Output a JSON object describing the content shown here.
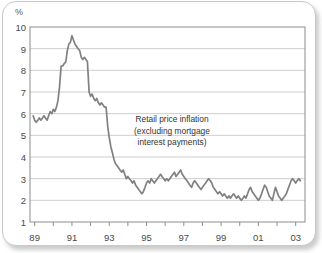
{
  "figure": {
    "unit_label": "%",
    "annotation_lines": [
      "Retail price inflation",
      "(excluding mortgage",
      "interest payments)"
    ],
    "line_color": "#808080",
    "grid_color": "#c0c0c0",
    "axis_color": "#8c8c8c",
    "frame_color": "#c9c9c9",
    "background_color": "#ffffff",
    "text_color": "#4a4a4a"
  },
  "chart_data": {
    "type": "line",
    "subtitle": "",
    "xlabel": "",
    "ylabel": "%",
    "ylim": [
      1,
      10
    ],
    "xlim": [
      1988.75,
      2003.5
    ],
    "grid": true,
    "grid_axis": "y",
    "legend": "none",
    "annotation": "Retail price inflation (excluding mortgage interest payments)",
    "ytick_labels": [
      "1",
      "2",
      "3",
      "4",
      "5",
      "6",
      "7",
      "8",
      "9",
      "10"
    ],
    "ytick_values": [
      1,
      2,
      3,
      4,
      5,
      6,
      7,
      8,
      9,
      10
    ],
    "xtick_labels": [
      "89",
      "91",
      "93",
      "95",
      "97",
      "99",
      "01",
      "03"
    ],
    "xtick_values": [
      1989,
      1991,
      1993,
      1995,
      1997,
      1999,
      2001,
      2003
    ],
    "xminor_values": [
      1990,
      1992,
      1994,
      1996,
      1998,
      2000,
      2002
    ],
    "series": [
      {
        "name": "Retail price inflation (excluding mortgage interest payments)",
        "color": "#808080",
        "x": [
          1988.92,
          1989.0,
          1989.08,
          1989.17,
          1989.25,
          1989.33,
          1989.42,
          1989.5,
          1989.58,
          1989.67,
          1989.75,
          1989.83,
          1989.92,
          1990.0,
          1990.08,
          1990.17,
          1990.25,
          1990.33,
          1990.42,
          1990.5,
          1990.58,
          1990.67,
          1990.75,
          1990.83,
          1990.92,
          1991.0,
          1991.08,
          1991.17,
          1991.25,
          1991.33,
          1991.42,
          1991.5,
          1991.58,
          1991.67,
          1991.75,
          1991.83,
          1991.92,
          1992.0,
          1992.08,
          1992.17,
          1992.25,
          1992.33,
          1992.42,
          1992.5,
          1992.58,
          1992.67,
          1992.75,
          1992.83,
          1992.92,
          1993.0,
          1993.08,
          1993.17,
          1993.25,
          1993.33,
          1993.42,
          1993.5,
          1993.58,
          1993.67,
          1993.75,
          1993.83,
          1993.92,
          1994.0,
          1994.08,
          1994.17,
          1994.25,
          1994.33,
          1994.42,
          1994.5,
          1994.58,
          1994.67,
          1994.75,
          1994.83,
          1994.92,
          1995.0,
          1995.08,
          1995.17,
          1995.25,
          1995.33,
          1995.42,
          1995.5,
          1995.58,
          1995.67,
          1995.75,
          1995.83,
          1995.92,
          1996.0,
          1996.08,
          1996.17,
          1996.25,
          1996.33,
          1996.42,
          1996.5,
          1996.58,
          1996.67,
          1996.75,
          1996.83,
          1996.92,
          1997.0,
          1997.08,
          1997.17,
          1997.25,
          1997.33,
          1997.42,
          1997.5,
          1997.58,
          1997.67,
          1997.75,
          1997.83,
          1997.92,
          1998.0,
          1998.08,
          1998.17,
          1998.25,
          1998.33,
          1998.42,
          1998.5,
          1998.58,
          1998.67,
          1998.75,
          1998.83,
          1998.92,
          1999.0,
          1999.08,
          1999.17,
          1999.25,
          1999.33,
          1999.42,
          1999.5,
          1999.58,
          1999.67,
          1999.75,
          1999.83,
          1999.92,
          2000.0,
          2000.08,
          2000.17,
          2000.25,
          2000.33,
          2000.42,
          2000.5,
          2000.58,
          2000.67,
          2000.75,
          2000.83,
          2000.92,
          2001.0,
          2001.08,
          2001.17,
          2001.25,
          2001.33,
          2001.42,
          2001.5,
          2001.58,
          2001.67,
          2001.75,
          2001.83,
          2001.92,
          2002.0,
          2002.08,
          2002.17,
          2002.25,
          2002.33,
          2002.42,
          2002.5,
          2002.58,
          2002.67,
          2002.75,
          2002.83,
          2002.92,
          2003.0,
          2003.08,
          2003.17,
          2003.25
        ],
        "y": [
          5.9,
          5.7,
          5.6,
          5.7,
          5.8,
          5.7,
          5.8,
          5.9,
          5.8,
          5.7,
          5.9,
          6.1,
          6.0,
          6.2,
          6.1,
          6.3,
          6.6,
          7.2,
          8.2,
          8.2,
          8.3,
          8.4,
          8.9,
          9.2,
          9.3,
          9.6,
          9.4,
          9.2,
          9.1,
          9.0,
          8.9,
          8.6,
          8.5,
          8.6,
          8.5,
          8.4,
          7.0,
          6.8,
          6.9,
          6.7,
          6.6,
          6.7,
          6.5,
          6.4,
          6.5,
          6.4,
          6.3,
          6.3,
          5.4,
          4.9,
          4.5,
          4.2,
          3.9,
          3.7,
          3.6,
          3.5,
          3.4,
          3.3,
          3.4,
          3.2,
          3.0,
          3.1,
          3.0,
          2.9,
          2.8,
          2.9,
          2.7,
          2.6,
          2.5,
          2.4,
          2.3,
          2.4,
          2.6,
          2.8,
          2.9,
          2.8,
          3.0,
          2.9,
          2.8,
          2.9,
          3.0,
          3.1,
          3.2,
          3.1,
          3.0,
          2.9,
          3.0,
          2.9,
          3.0,
          3.1,
          3.2,
          3.3,
          3.1,
          3.2,
          3.3,
          3.4,
          3.2,
          3.1,
          3.0,
          2.9,
          2.8,
          2.7,
          2.6,
          2.8,
          2.9,
          2.8,
          2.7,
          2.6,
          2.5,
          2.6,
          2.7,
          2.8,
          2.9,
          3.0,
          2.9,
          2.8,
          2.6,
          2.5,
          2.4,
          2.3,
          2.4,
          2.3,
          2.2,
          2.3,
          2.2,
          2.1,
          2.2,
          2.1,
          2.2,
          2.3,
          2.2,
          2.1,
          2.2,
          2.1,
          2.0,
          2.1,
          2.2,
          2.1,
          2.3,
          2.5,
          2.6,
          2.4,
          2.3,
          2.2,
          2.1,
          2.0,
          2.1,
          2.3,
          2.5,
          2.7,
          2.6,
          2.4,
          2.2,
          2.1,
          2.0,
          2.3,
          2.6,
          2.4,
          2.2,
          2.1,
          2.0,
          2.1,
          2.2,
          2.3,
          2.5,
          2.7,
          2.9,
          3.0,
          2.9,
          2.8,
          2.9,
          3.0,
          2.9
        ]
      }
    ]
  }
}
